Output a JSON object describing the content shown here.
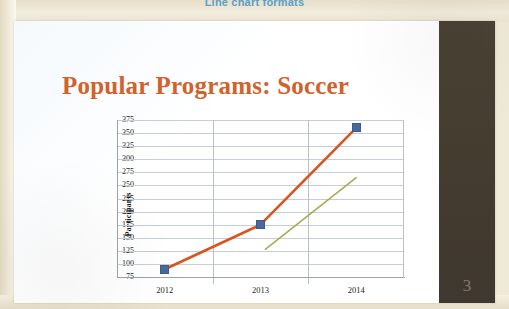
{
  "document": {
    "top_heading": "Line chart formats",
    "page_number": "3"
  },
  "slide": {
    "title": "Popular Programs: Soccer"
  },
  "colors": {
    "title_orange": "#d2622b",
    "series_orange": "#d9541f",
    "series_olive": "#a9aa4d",
    "marker_blue": "#49689c",
    "sidebar_brown": "#473f31",
    "heading_blue": "#4f9bc4",
    "gridline_grey": "#c7cdd4",
    "paper_cream": "#efe9d8"
  },
  "chart_data": {
    "type": "line",
    "title": "Popular Programs: Soccer",
    "xlabel": "",
    "ylabel": "Participants",
    "categories": [
      "2012",
      "2013",
      "2014"
    ],
    "ylim": [
      75,
      375
    ],
    "ytick_step": 25,
    "yticks": [
      "375",
      "350",
      "325",
      "300",
      "275",
      "250",
      "225",
      "200",
      "175",
      "150",
      "125",
      "100",
      "75"
    ],
    "grid": true,
    "legend": "none",
    "series": [
      {
        "name": "Soccer participants",
        "color": "#d9541f",
        "marker": "square",
        "marker_color": "#49689c",
        "categories": [
          "2012",
          "2013",
          "2014"
        ],
        "values": [
          90,
          175,
          360
        ]
      },
      {
        "name": "Secondary trend line",
        "color": "#a9aa4d",
        "marker": "none",
        "x": [
          2013.05,
          2014.0
        ],
        "values": [
          128,
          265
        ]
      }
    ]
  }
}
